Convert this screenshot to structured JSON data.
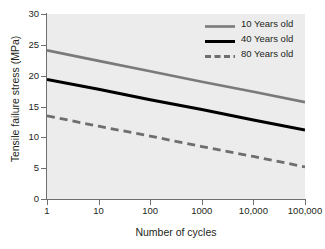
{
  "chart_data": {
    "type": "line",
    "title": "",
    "xlabel": "Number of cycles",
    "ylabel": "Tensile failure stress (MPa)",
    "x_scale": "log",
    "y_scale": "linear",
    "xlim": [
      1,
      100000
    ],
    "ylim": [
      0,
      30
    ],
    "grid": false,
    "legend_position": "top-right",
    "x_ticks": [
      1,
      10,
      100,
      1000,
      10000,
      100000
    ],
    "x_tick_labels": [
      "1",
      "10",
      "100",
      "1000",
      "10,000",
      "100,000"
    ],
    "y_ticks": [
      0,
      5,
      10,
      15,
      20,
      25,
      30
    ],
    "y_tick_labels": [
      "0",
      "5",
      "10",
      "15",
      "20",
      "25",
      "30"
    ],
    "series": [
      {
        "name": "10 Years old",
        "color": "#7a7a7a",
        "style": "solid",
        "width": 2.6,
        "x": [
          1,
          10,
          100,
          1000,
          10000,
          100000
        ],
        "values": [
          24.1,
          22.4,
          20.7,
          19.0,
          17.4,
          15.7
        ]
      },
      {
        "name": "40 Years old",
        "color": "#000000",
        "style": "solid",
        "width": 3.0,
        "x": [
          1,
          10,
          100,
          1000,
          10000,
          100000
        ],
        "values": [
          19.4,
          17.8,
          16.1,
          14.5,
          12.8,
          11.2
        ]
      },
      {
        "name": "80 Years old",
        "color": "#6e6e6e",
        "style": "dashed",
        "width": 2.8,
        "x": [
          1,
          10,
          100,
          1000,
          10000,
          100000
        ],
        "values": [
          13.5,
          11.8,
          10.2,
          8.5,
          6.9,
          5.2
        ]
      }
    ]
  },
  "axes": {
    "x_label": "Number of cycles",
    "y_label": "Tensile failure stress (MPa)",
    "x_tick_labels": [
      "1",
      "10",
      "100",
      "1000",
      "10,000",
      "100,000"
    ],
    "y_tick_labels": [
      "0",
      "5",
      "10",
      "15",
      "20",
      "25",
      "30"
    ]
  },
  "legend": {
    "entries": [
      {
        "label": "10 Years old"
      },
      {
        "label": "40 Years old"
      },
      {
        "label": "80 Years old"
      }
    ]
  },
  "colors": {
    "plot_background": "#ececec",
    "figure_background": "#ffffff",
    "axis": "#6f6f6f",
    "text": "#231f20"
  }
}
